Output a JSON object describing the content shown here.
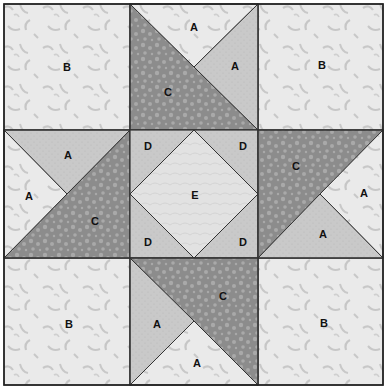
{
  "diagram": {
    "type": "quilt-block",
    "grid": "3x3",
    "colors": {
      "light": "#eaeaea",
      "light_motif": "#c4c4c4",
      "medium": "#c9c9c9",
      "dark": "#8e8e8e",
      "dark_motif": "#b0b0b0",
      "center": "#dcdcdc",
      "outline": "#333333"
    },
    "labels": {
      "tl_b": "B",
      "tr_b": "B",
      "bl_b": "B",
      "br_b": "B",
      "tm_a_top": "A",
      "tm_a_right": "A",
      "tm_c": "C",
      "ml_a_top": "A",
      "ml_a_left": "A",
      "ml_c": "C",
      "mr_c": "C",
      "mr_a_right": "A",
      "mr_a_bottom": "A",
      "bm_c": "C",
      "bm_a_left": "A",
      "bm_a_bottom": "A",
      "c_d_tl": "D",
      "c_d_tr": "D",
      "c_d_bl": "D",
      "c_d_br": "D",
      "c_e": "E"
    },
    "pieces": [
      {
        "id": "A",
        "description": "quarter-square triangle (light and medium fabrics)"
      },
      {
        "id": "B",
        "description": "corner square (light fabric)"
      },
      {
        "id": "C",
        "description": "half-square triangle (dark fabric)"
      },
      {
        "id": "D",
        "description": "center corner triangle (medium fabric)"
      },
      {
        "id": "E",
        "description": "center square on point (light fabric)"
      }
    ]
  }
}
